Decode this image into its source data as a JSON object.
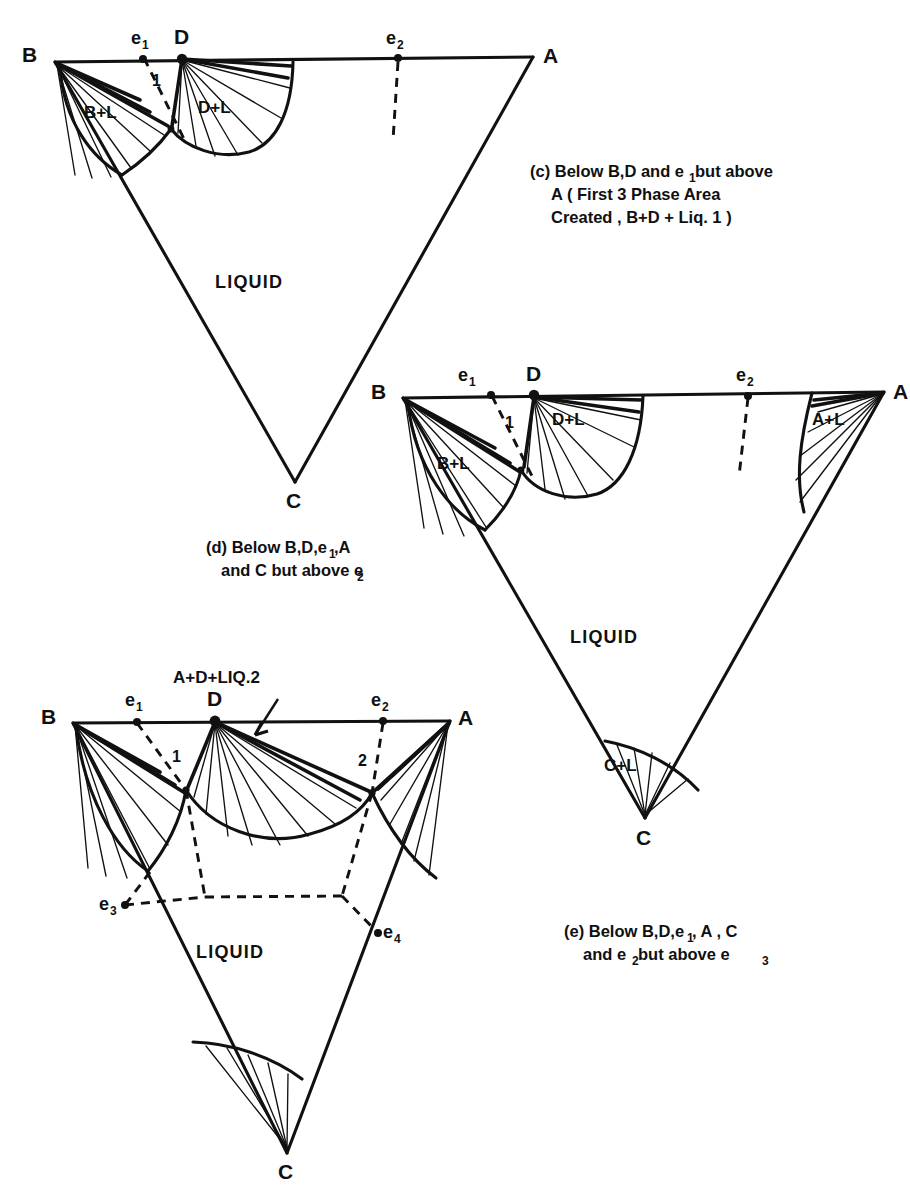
{
  "figure": {
    "kind": "ternary-phase-diagram-series",
    "background": "#ffffff",
    "ink": "#111111"
  },
  "panels": [
    {
      "id": "c",
      "caption_lines": [
        "(c) Below B,D and e₁ but above",
        "A ( First 3 Phase  Area",
        "Created , B+D + Liq. 1 )"
      ],
      "caption_tag": "(c)",
      "vertices": [
        {
          "name": "B",
          "label": "B"
        },
        {
          "name": "A",
          "label": "A"
        },
        {
          "name": "C",
          "label": "C"
        }
      ],
      "edge_points": [
        {
          "name": "e1",
          "base": "e",
          "sub": "1"
        },
        {
          "name": "D",
          "base": "D",
          "sub": ""
        },
        {
          "name": "e2",
          "base": "e",
          "sub": "2"
        }
      ],
      "invariant_points": [
        "1"
      ],
      "regions": [
        {
          "name": "B+L",
          "label": "B+L"
        },
        {
          "name": "D+L",
          "label": "D+L"
        },
        {
          "name": "LIQUID",
          "label": "LIQUID"
        }
      ]
    },
    {
      "id": "d",
      "caption_lines": [
        "(d) Below B,D,e₁ ,A",
        "and C but above e₂"
      ],
      "caption_tag": "(d)",
      "vertices": [
        {
          "name": "B",
          "label": "B"
        },
        {
          "name": "A",
          "label": "A"
        },
        {
          "name": "C",
          "label": "C"
        }
      ],
      "edge_points": [
        {
          "name": "e1",
          "base": "e",
          "sub": "1"
        },
        {
          "name": "D",
          "base": "D",
          "sub": ""
        },
        {
          "name": "e2",
          "base": "e",
          "sub": "2"
        }
      ],
      "invariant_points": [
        "1"
      ],
      "regions": [
        {
          "name": "B+L",
          "label": "B+L"
        },
        {
          "name": "D+L",
          "label": "D+L"
        },
        {
          "name": "A+L",
          "label": "A+L"
        },
        {
          "name": "C+L",
          "label": "C+L"
        },
        {
          "name": "LIQUID",
          "label": "LIQUID"
        }
      ]
    },
    {
      "id": "e",
      "caption_lines": [
        "(e) Below B,D,e₁ , A , C",
        "and e₂ but above e₃"
      ],
      "caption_tag": "(e)",
      "vertices": [
        {
          "name": "B",
          "label": "B"
        },
        {
          "name": "A",
          "label": "A"
        },
        {
          "name": "C",
          "label": "C"
        }
      ],
      "edge_points": [
        {
          "name": "e1",
          "base": "e",
          "sub": "1"
        },
        {
          "name": "D",
          "base": "D",
          "sub": ""
        },
        {
          "name": "e2",
          "base": "e",
          "sub": "2"
        },
        {
          "name": "e3",
          "base": "e",
          "sub": "3"
        },
        {
          "name": "e4",
          "base": "e",
          "sub": "4"
        }
      ],
      "invariant_points": [
        "1",
        "2"
      ],
      "annotation": "A+D+LIQ.2",
      "regions": [
        {
          "name": "LIQUID",
          "label": "LIQUID"
        }
      ]
    }
  ],
  "labels": {
    "B": "B",
    "A": "A",
    "C": "C",
    "D": "D",
    "e": "e",
    "sub1": "1",
    "sub2": "2",
    "sub3": "3",
    "sub4": "4",
    "one": "1",
    "two": "2",
    "BL": "B+L",
    "DL": "D+L",
    "AL": "A+L",
    "CL": "C+L",
    "LIQUID": "LIQUID",
    "ADLIQ2": "A+D+LIQ.2"
  },
  "captions": {
    "c_l1": "(c) Below B,D and e",
    "c_l1b": " but above",
    "c_l2": "A ( First 3 Phase  Area",
    "c_l3": "Created , B+D + Liq. 1 )",
    "d_l1a": "(d) Below B,D,e",
    "d_l1b": " ,A",
    "d_l2a": "and C but above e",
    "e_l1a": "(e) Below B,D,e",
    "e_l1b": " , A , C",
    "e_l2a": "and e",
    "e_l2b": " but above e"
  }
}
